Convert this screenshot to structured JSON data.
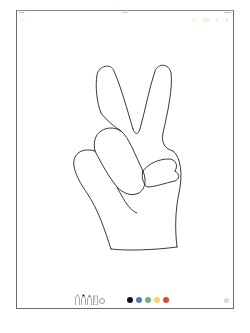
{
  "status_bar": {
    "left": "iPad",
    "time": "9:41",
    "right": "100%"
  },
  "nav": {
    "back_label": "‹ ⁝⁝",
    "actions": [
      {
        "name": "add-people-icon",
        "glyph": "⚇"
      },
      {
        "name": "trash-icon",
        "glyph": "⌫"
      },
      {
        "name": "share-icon",
        "glyph": "⇪"
      },
      {
        "name": "compose-icon",
        "glyph": "✎"
      }
    ],
    "accent_color": "#f3cf95"
  },
  "canvas": {
    "drawing": "peace-sign-hand",
    "stroke_color": "#222222"
  },
  "toolbar": {
    "tools": [
      {
        "name": "pen-tool"
      },
      {
        "name": "marker-tool"
      },
      {
        "name": "pencil-tool"
      },
      {
        "name": "ruler-tool"
      },
      {
        "name": "lasso-tool"
      }
    ],
    "colors": [
      {
        "name": "black",
        "hex": "#111111"
      },
      {
        "name": "blue",
        "hex": "#4f78c4"
      },
      {
        "name": "green",
        "hex": "#6db56b"
      },
      {
        "name": "yellow",
        "hex": "#f5d663"
      },
      {
        "name": "red",
        "hex": "#e8443a"
      }
    ]
  }
}
